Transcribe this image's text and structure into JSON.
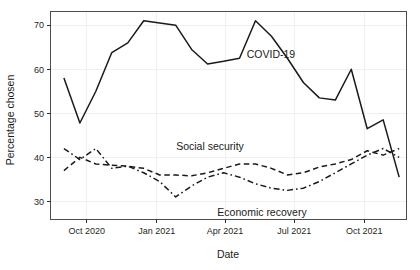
{
  "chart_data": {
    "type": "line",
    "title": "",
    "xlabel": "Date",
    "ylabel": "Percentage chosen",
    "ylim": [
      26,
      73
    ],
    "yticks": [
      30,
      40,
      50,
      60,
      70
    ],
    "ytick_labels": [
      "30",
      "40",
      "50",
      "60",
      "70"
    ],
    "xlim": [
      "2020-08-15",
      "2021-11-25"
    ],
    "xticks": [
      "2020-10-01",
      "2021-01-01",
      "2021-04-01",
      "2021-07-01",
      "2021-10-01"
    ],
    "xtick_labels": [
      "Oct 2020",
      "Jan 2021",
      "Apr 2021",
      "Jul 2021",
      "Oct 2021"
    ],
    "grid": true,
    "legend_position": "inline-annotations",
    "x": [
      "2020-09-01",
      "2020-09-22",
      "2020-10-13",
      "2020-11-03",
      "2020-11-24",
      "2020-12-15",
      "2021-01-05",
      "2021-01-26",
      "2021-02-16",
      "2021-03-09",
      "2021-03-30",
      "2021-04-20",
      "2021-05-11",
      "2021-06-01",
      "2021-06-22",
      "2021-07-13",
      "2021-08-03",
      "2021-08-24",
      "2021-09-14",
      "2021-10-05",
      "2021-10-26",
      "2021-11-16"
    ],
    "series": [
      {
        "name": "COVID-19",
        "linestyle": "solid",
        "color": "#1a1a1a",
        "values": [
          58.0,
          47.8,
          55.0,
          63.8,
          66.0,
          71.0,
          70.5,
          70.0,
          64.5,
          61.2,
          61.8,
          62.5,
          71.0,
          67.5,
          62.5,
          57.0,
          53.5,
          53.0,
          60.0,
          46.5,
          48.5,
          35.5
        ]
      },
      {
        "name": "Social security",
        "linestyle": "dashed",
        "color": "#1a1a1a",
        "values": [
          37.0,
          40.0,
          38.5,
          38.2,
          38.0,
          37.5,
          36.0,
          36.0,
          35.8,
          36.5,
          37.5,
          38.5,
          38.5,
          37.5,
          36.0,
          36.5,
          37.8,
          38.5,
          39.5,
          41.5,
          40.5,
          42.0
        ]
      },
      {
        "name": "Economic recovery",
        "linestyle": "dashdot",
        "color": "#1a1a1a",
        "values": [
          42.0,
          39.5,
          42.0,
          37.5,
          38.0,
          36.5,
          34.5,
          31.0,
          33.5,
          35.5,
          36.5,
          35.5,
          34.0,
          33.0,
          32.5,
          33.0,
          34.5,
          36.5,
          38.5,
          40.5,
          42.0,
          40.0
        ]
      }
    ],
    "annotations": [
      {
        "text": "COVID-19",
        "x_px": 271,
        "y_px": 58
      },
      {
        "text": "Social security",
        "x_px": 210,
        "y_px": 150
      },
      {
        "text": "Economic recovery",
        "x_px": 262,
        "y_px": 216
      }
    ]
  }
}
